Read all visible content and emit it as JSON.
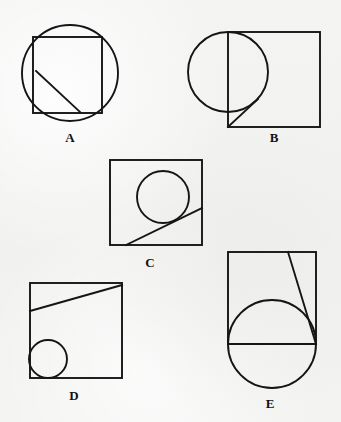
{
  "page": {
    "kind": "geometry-figure-sheet",
    "width": 341,
    "height": 422,
    "background_color": "#f3f3f2",
    "stroke_color": "#151515"
  },
  "figures": [
    {
      "id": "A",
      "label": "A",
      "label_x": 70,
      "label_y": 131,
      "description": "Circle with an inscribed-width square whose left and right sides extend past the circle; a diagonal segment inside the square from the left side down to the bottom side.",
      "shapes": [
        {
          "kind": "circle",
          "name": "circle-a",
          "cx": 70,
          "cy": 73,
          "r": 48
        },
        {
          "kind": "rect",
          "name": "square-a",
          "x": 33,
          "y": 37,
          "w": 69,
          "h": 76
        },
        {
          "kind": "line",
          "name": "diagonal-a",
          "x1": 36,
          "y1": 71,
          "x2": 80,
          "y2": 112
        }
      ]
    },
    {
      "id": "B",
      "label": "B",
      "label_x": 274,
      "label_y": 131,
      "description": "Square with a circle overlapping its left edge, tangent to the square's top-left corner; a short diagonal from the square's bottom-left corner up-right to the circle.",
      "shapes": [
        {
          "kind": "rect",
          "name": "square-b",
          "x": 228,
          "y": 32,
          "w": 92,
          "h": 95
        },
        {
          "kind": "circle",
          "name": "circle-b",
          "cx": 228,
          "cy": 72,
          "r": 40
        },
        {
          "kind": "line",
          "name": "diagonal-b",
          "x1": 228,
          "y1": 127,
          "x2": 258,
          "y2": 99
        }
      ]
    },
    {
      "id": "C",
      "label": "C",
      "label_x": 150,
      "label_y": 256,
      "description": "Square containing a circle in the upper-right region and a diagonal line tangent to the circle running from the bottom edge up to the right edge.",
      "shapes": [
        {
          "kind": "rect",
          "name": "square-c",
          "x": 110,
          "y": 160,
          "w": 92,
          "h": 85
        },
        {
          "kind": "circle",
          "name": "circle-c",
          "cx": 163,
          "cy": 197,
          "r": 26
        },
        {
          "kind": "line",
          "name": "diagonal-c",
          "x1": 126,
          "y1": 245,
          "x2": 202,
          "y2": 208
        }
      ]
    },
    {
      "id": "D",
      "label": "D",
      "label_x": 74,
      "label_y": 389,
      "description": "Square with a diagonal line from the left edge up to the top-right corner and a circle tangent to the left and bottom edges.",
      "shapes": [
        {
          "kind": "rect",
          "name": "square-d",
          "x": 30,
          "y": 283,
          "w": 92,
          "h": 95
        },
        {
          "kind": "line",
          "name": "diagonal-d",
          "x1": 30,
          "y1": 311,
          "x2": 122,
          "y2": 285
        },
        {
          "kind": "circle",
          "name": "circle-d",
          "cx": 48,
          "cy": 359,
          "r": 19
        }
      ]
    },
    {
      "id": "E",
      "label": "E",
      "label_x": 270,
      "label_y": 397,
      "description": "Square with a large circle centered on its bottom edge extending below it; a chord along the square's bottom edge and a diagonal from the top edge down to the bottom-right corner.",
      "shapes": [
        {
          "kind": "rect",
          "name": "square-e",
          "x": 228,
          "y": 252,
          "w": 88,
          "h": 92
        },
        {
          "kind": "circle",
          "name": "circle-e",
          "cx": 272,
          "cy": 344,
          "r": 44
        },
        {
          "kind": "line",
          "name": "chord-e",
          "x1": 228,
          "y1": 344,
          "x2": 316,
          "y2": 344
        },
        {
          "kind": "line",
          "name": "diagonal-e",
          "x1": 288,
          "y1": 252,
          "x2": 316,
          "y2": 344
        }
      ]
    }
  ]
}
